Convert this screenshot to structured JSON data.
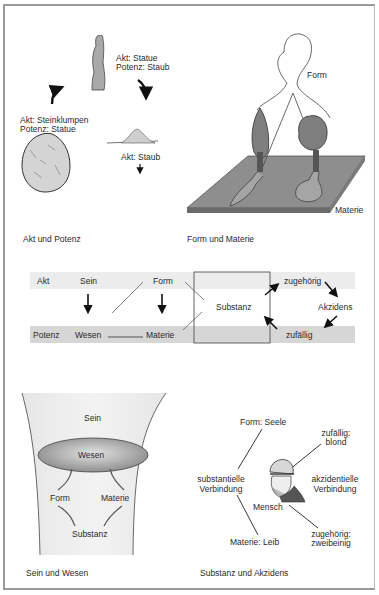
{
  "panels": {
    "akt_potenz": {
      "caption": "Akt und Potenz",
      "statue_label": [
        "Akt: Statue",
        "Potenz: Staub"
      ],
      "stone_label": [
        "Akt: Steinklumpen",
        "Potenz: Statue"
      ],
      "dust_label": "Akt: Staub"
    },
    "form_materie": {
      "caption": "Form und Materie",
      "form_label": "Form",
      "materie_label": "Materie"
    },
    "schema": {
      "top_row": {
        "akt": "Akt",
        "sein": "Sein",
        "form": "Form",
        "zugehoerig": "zugehörig"
      },
      "middle": {
        "substanz": "Substanz",
        "akzidens": "Akzidens"
      },
      "bottom_row": {
        "potenz": "Potenz",
        "wesen": "Wesen",
        "materie": "Materie",
        "zufaellig": "zufällig"
      },
      "colors": {
        "top_bar": "#ececec",
        "bottom_bar": "#d6d6d6"
      }
    },
    "sein_wesen": {
      "caption": "Sein und Wesen",
      "sein": "Sein",
      "wesen": "Wesen",
      "form": "Form",
      "materie": "Materie",
      "substanz": "Substanz"
    },
    "substanz_akzidens": {
      "caption": "Substanz und Akzidens",
      "form_seele": "Form: Seele",
      "zufaellig": [
        "zufällig:",
        "blond"
      ],
      "substantielle": [
        "substantielle",
        "Verbindung"
      ],
      "akzidentielle": [
        "akzidentielle",
        "Verbindung"
      ],
      "mensch": "Mensch",
      "zugehoerig": [
        "zugehörig:",
        "zweibeinig"
      ],
      "materie_leib": "Materie: Leib"
    }
  }
}
